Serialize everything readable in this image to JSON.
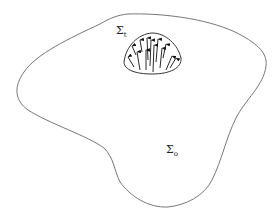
{
  "diagram": {
    "type": "region-with-subregion",
    "outer_region": {
      "label_symbol": "Σ",
      "label_subscript": "o",
      "stroke_color": "#777777"
    },
    "inner_region": {
      "label_symbol": "Σ",
      "label_subscript": "t",
      "stroke_color": "#333333",
      "arrows": "upward-pointing arrows distributed inside the dome",
      "arrow_color": "#111111"
    }
  }
}
